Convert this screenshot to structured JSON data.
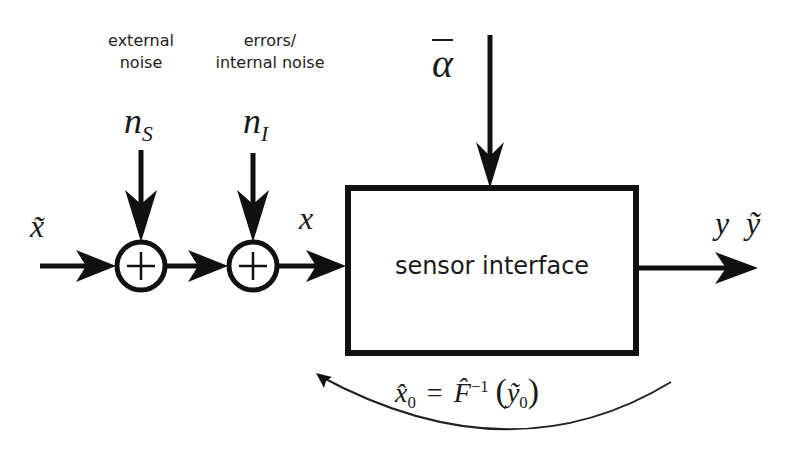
{
  "diagram": {
    "labels": {
      "external_noise": [
        "external",
        "noise"
      ],
      "internal_noise": [
        "errors/",
        "internal noise"
      ],
      "n_s": {
        "base": "n",
        "sub": "S"
      },
      "n_i": {
        "base": "n",
        "sub": "I"
      },
      "alpha_bar": "α",
      "x_tilde": "x̃",
      "x": "x",
      "y": "y",
      "y_tilde": "ỹ",
      "feedback_formula": {
        "lhs_base": "x̂",
        "lhs_sub": "0",
        "equals": "=",
        "f_base": "F̂",
        "f_sup": "−1",
        "open_paren": "(",
        "arg_base": "ỹ",
        "arg_sub": "0",
        "close_paren": ")"
      }
    },
    "blocks": {
      "sensor_interface": "sensor interface"
    },
    "junctions": [
      {
        "id": "sum-ns",
        "symbol": "+"
      },
      {
        "id": "sum-ni",
        "symbol": "+"
      }
    ],
    "colors": {
      "stroke": "#111111",
      "background": "#ffffff",
      "text": "#222222"
    }
  }
}
